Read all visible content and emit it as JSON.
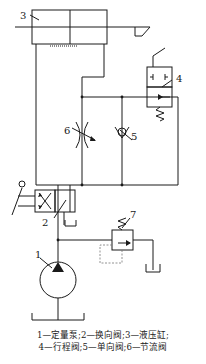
{
  "diagram": {
    "type": "hydraulic-circuit",
    "components": [
      {
        "id": "1",
        "label": "1",
        "name": "定量泵"
      },
      {
        "id": "2",
        "label": "2",
        "name": "换向阀"
      },
      {
        "id": "3",
        "label": "3",
        "name": "液压缸"
      },
      {
        "id": "4",
        "label": "4",
        "name": "行程阀"
      },
      {
        "id": "5",
        "label": "5",
        "name": "单向阀"
      },
      {
        "id": "6",
        "label": "6",
        "name": "节流阀"
      },
      {
        "id": "7",
        "label": "7",
        "name": ""
      }
    ],
    "caption": {
      "line1": "1—定量泵;2—换向阀;3—液压缸;",
      "line2": "4—行程阀;5—单向阀;6—节流阀"
    },
    "colors": {
      "line": "#1a1a1a",
      "pilot": "#777777",
      "background": "#ffffff"
    }
  }
}
